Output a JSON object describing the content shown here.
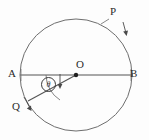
{
  "figure": {
    "type": "geometry-diagram",
    "background_color": "#fdfdfd",
    "stroke_color": "#5a5a5a",
    "label_color": "#2b2b2b"
  },
  "circle": {
    "center_x": 76,
    "center_y": 75,
    "radius": 56,
    "stroke_color": "#6e6e6e",
    "stroke_width": 1
  },
  "points": {
    "center": {
      "label": "O",
      "x": 76,
      "y": 75
    },
    "left_end": {
      "label": "A",
      "x": 20,
      "y": 75
    },
    "right_end": {
      "label": "B",
      "x": 132,
      "y": 75
    },
    "arc_point": {
      "label": "P",
      "x": 117,
      "y": 27
    },
    "radius_point": {
      "label": "Q",
      "x": 28,
      "y": 101
    }
  },
  "segments": {
    "diameter": {
      "name": "AB",
      "from": "A",
      "to": "B"
    },
    "radius": {
      "name": "OQ",
      "from": "O",
      "to": "Q"
    }
  },
  "angle": {
    "symbol": "θ",
    "vertex": "O",
    "between": "OA and OQ",
    "marker_style": "circled"
  },
  "arrows": {
    "p_arrow": {
      "points_to": "P on circle",
      "direction": "down-left"
    },
    "q_arrow": {
      "points_to": "Q direction",
      "direction": "down-right"
    },
    "angle_arrow": {
      "points_to": "angle region",
      "direction": "down"
    }
  }
}
